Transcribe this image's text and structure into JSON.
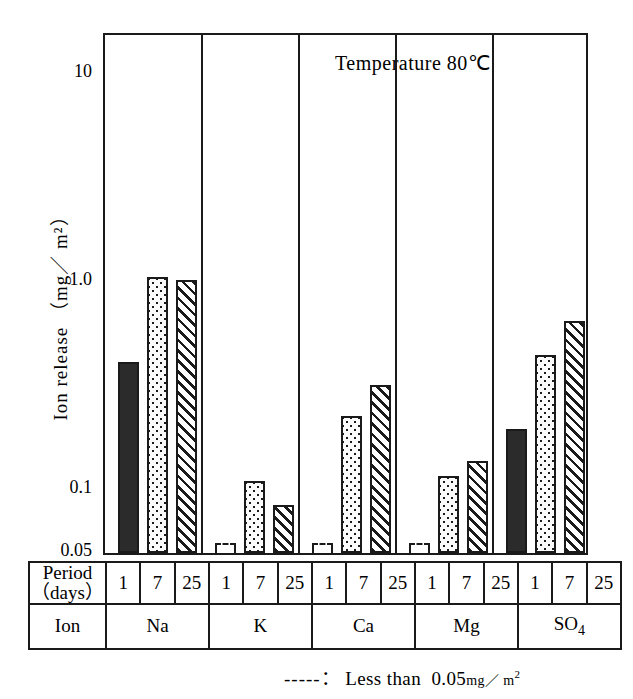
{
  "chart_data": {
    "type": "bar",
    "title": "",
    "annotation": "Temperature  80℃",
    "ylabel": "Ion release （mg／ m²）",
    "xlabel": "",
    "yscale": "log",
    "ylim": [
      0.04,
      16
    ],
    "ytick_values": [
      10,
      1.0,
      0.1,
      0.05
    ],
    "ytick_labels": [
      "10",
      "1.0",
      "0.1",
      "0.05"
    ],
    "grid": false,
    "legend_position": "none",
    "categories": [
      "Na",
      "K",
      "Ca",
      "Mg",
      "SO4"
    ],
    "series": [
      {
        "name": "1",
        "fill": "solid",
        "values": [
          0.4,
          null,
          null,
          null,
          0.19
        ]
      },
      {
        "name": "7",
        "fill": "dotted",
        "values": [
          1.02,
          0.107,
          0.22,
          0.113,
          0.43
        ]
      },
      {
        "name": "25",
        "fill": "hatched",
        "values": [
          0.99,
          0.082,
          0.31,
          0.133,
          0.63
        ]
      }
    ],
    "null_note": "below detection limit (less than 0.05)"
  },
  "axis": {
    "y_title": "Ion release （mg／ m²）",
    "ticks": [
      {
        "label": "10",
        "value": 10
      },
      {
        "label": "1.0",
        "value": 1.0
      },
      {
        "label": "0.1",
        "value": 0.1
      },
      {
        "label": "0.05",
        "value": 0.05
      }
    ]
  },
  "annotation": {
    "temperature": "Temperature  80℃"
  },
  "table": {
    "period_label_line1": "Period",
    "period_label_line2": "（days）",
    "ion_label": "Ion",
    "periods": [
      "1",
      "7",
      "25",
      "1",
      "7",
      "25",
      "1",
      "7",
      "25",
      "1",
      "7",
      "25",
      "1",
      "7",
      "25"
    ],
    "ions": [
      {
        "name": "Na",
        "sub": ""
      },
      {
        "name": "K",
        "sub": ""
      },
      {
        "name": "Ca",
        "sub": ""
      },
      {
        "name": "Mg",
        "sub": ""
      },
      {
        "name": "SO",
        "sub": "4"
      }
    ]
  },
  "footnote": {
    "dashes": "-----",
    "separator": "：",
    "text": "Less  than",
    "value": "0.05",
    "unit": "mg／ m",
    "unit_sup": "2"
  },
  "colors": {
    "ink": "#1a1a1a",
    "solid_fill": "#2b2b2b",
    "paper": "#ffffff"
  }
}
